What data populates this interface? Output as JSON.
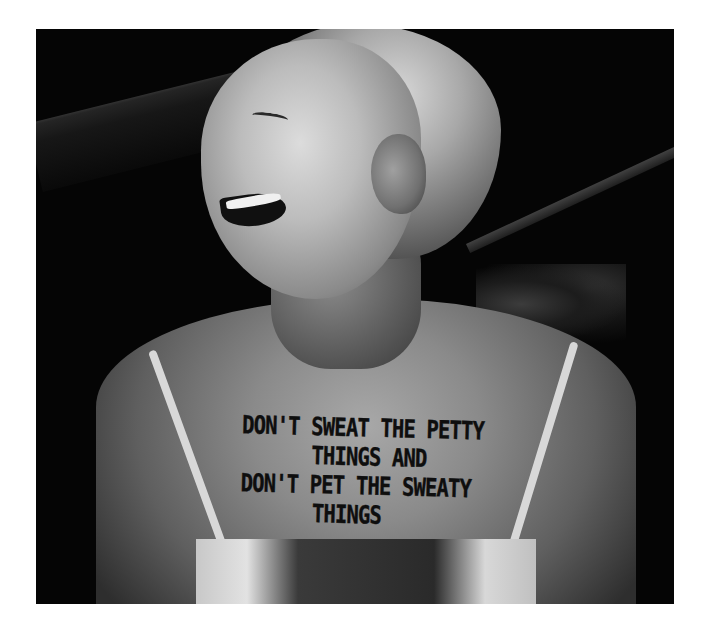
{
  "image": {
    "description": "Black-and-white photo of a laughing woman with short blonde hair, wearing a camisole with thin straps; text hand-written across her chest",
    "palette": {
      "background": "#ffffff",
      "photo_dark": "#050505",
      "skin_light": "#dcdcdc",
      "ink": "#0e0e0e"
    }
  },
  "chest_text": {
    "lines": [
      "DON'T SWEAT THE PETTY",
      "THINGS AND",
      "DON'T PET THE SWEATY",
      "THINGS"
    ]
  }
}
